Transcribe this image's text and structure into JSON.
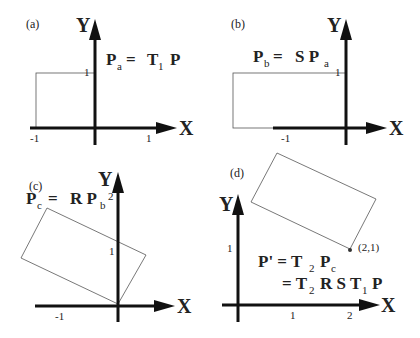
{
  "panels": {
    "a": {
      "label": "(a)",
      "eq": {
        "lhs": "P",
        "lhs_sub": "a",
        "eqsign": "=",
        "t": "T",
        "t_sub": "1",
        "p": "P"
      },
      "ticks": {
        "y1": "1",
        "xm1": "-1",
        "x1": "1"
      }
    },
    "b": {
      "label": "(b)",
      "eq": {
        "lhs": "P",
        "lhs_sub": "b",
        "eqsign": "=",
        "s": "S P",
        "s_sub": "a"
      },
      "ticks": {
        "y1": "1",
        "xm1": "-1"
      }
    },
    "c": {
      "label": "(c)",
      "eq": {
        "lhs": "P",
        "lhs_sub": "c",
        "eqsign": "=",
        "r": "R P",
        "r_sub": "b"
      },
      "ticks": {
        "y2": "2",
        "y1": "1",
        "xm1": "-1"
      }
    },
    "d": {
      "label": "(d)",
      "eq1": {
        "lhs": "P' = T",
        "sub": "2",
        "rest": "P",
        "rest_sub": "c"
      },
      "eq2": {
        "a": "= T",
        "a_sub": "2",
        "b": "R S T",
        "b_sub": "1",
        "c": "P"
      },
      "point": "(2,1)",
      "ticks": {
        "y1": "1",
        "x1": "1",
        "x2": "2"
      }
    }
  },
  "axes": {
    "x": "X",
    "y": "Y"
  }
}
